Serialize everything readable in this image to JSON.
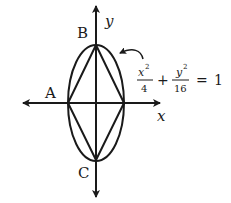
{
  "diagram": {
    "type": "ellipse-with-inscribed-rhombus",
    "axes": {
      "x_label": "x",
      "y_label": "y"
    },
    "points": {
      "A": "A",
      "B": "B",
      "C": "C"
    },
    "equation": {
      "term1_numerator": "x",
      "term1_exponent": "2",
      "term1_denominator": "4",
      "plus": "+",
      "term2_numerator": "y",
      "term2_exponent": "2",
      "term2_denominator": "16",
      "equals": "=",
      "rhs": "1"
    },
    "colors": {
      "stroke": "#1a1a1a",
      "background": "#ffffff"
    }
  }
}
